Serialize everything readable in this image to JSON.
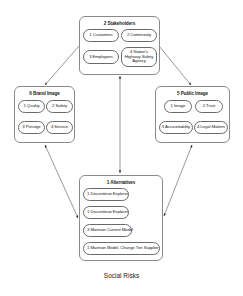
{
  "diagram": {
    "caption": "Social Risks",
    "nodes": {
      "stakeholders": {
        "title": "2 Stakeholders",
        "items": [
          {
            "label": "1 Customers"
          },
          {
            "label": "2 Community"
          },
          {
            "label": "3 Employees"
          },
          {
            "label": "4 Nation's Highway Safety Agency"
          }
        ]
      },
      "brand_image": {
        "title": "6 Brand Image",
        "items": [
          {
            "label": "1 Quality"
          },
          {
            "label": "2 Safety"
          },
          {
            "label": "3 Prestige"
          },
          {
            "label": "4 Service"
          }
        ]
      },
      "public_image": {
        "title": "5 Public Image",
        "items": [
          {
            "label": "1 Image"
          },
          {
            "label": "2 Trust"
          },
          {
            "label": "3 Accountability"
          },
          {
            "label": "4 Legal Matters"
          }
        ]
      },
      "alternatives": {
        "title": "1 Alternatives",
        "items": [
          {
            "label": "1 Discontinue Explorer"
          },
          {
            "label": "1 Discontinue Explorer"
          },
          {
            "label": "3 Maintain Current Model"
          },
          {
            "label": "1 Maintain Model, Change Tire Supplier"
          }
        ]
      }
    },
    "edges": [
      {
        "from": "stakeholders",
        "to": "brand_image",
        "direction": "to"
      },
      {
        "from": "stakeholders",
        "to": "public_image",
        "direction": "to"
      },
      {
        "from": "stakeholders",
        "to": "alternatives",
        "direction": "both"
      },
      {
        "from": "brand_image",
        "to": "alternatives",
        "direction": "both"
      },
      {
        "from": "public_image",
        "to": "alternatives",
        "direction": "both"
      }
    ],
    "colors": {
      "line": "#555555",
      "box_border": "#8a8a8a",
      "background": "#ffffff"
    }
  }
}
